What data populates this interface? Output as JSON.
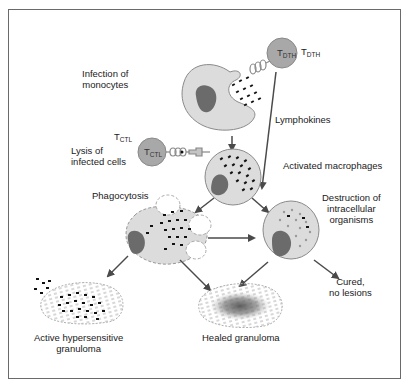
{
  "figure": {
    "labels": {
      "infection": [
        "Infection of",
        "monocytes"
      ],
      "lysis": [
        "Lysis of",
        "infected cells"
      ],
      "lymphokines": "Lymphokines",
      "activated": "Activated macrophages",
      "phagocytosis": "Phagocytosis",
      "destruction": [
        "Destruction of",
        "intracellular",
        "organisms"
      ],
      "cured": [
        "Cured,",
        "no lesions"
      ],
      "active_granuloma": [
        "Active hypersensitive",
        "granuloma"
      ],
      "healed_granuloma": "Healed granuloma"
    },
    "cells": {
      "tdth": {
        "main": "T",
        "sub": "DTH"
      },
      "tctl": {
        "main": "T",
        "sub": "CTL"
      }
    },
    "colors": {
      "cell_fill": "#dcdcdc",
      "cell_stroke": "#8a8a8a",
      "nucleus": "#6b6b6b",
      "tcell": "#a8a8a8",
      "arrow": "#4a4a4a",
      "border": "#6a6a6a"
    }
  }
}
